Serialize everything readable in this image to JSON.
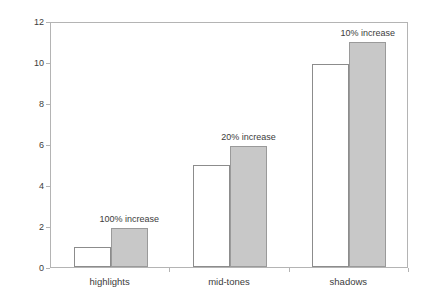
{
  "chart_data": {
    "type": "bar",
    "title": "",
    "xlabel": "",
    "ylabel": "units of exposure",
    "categories": [
      "highlights",
      "mid-tones",
      "shadows"
    ],
    "series": [
      {
        "name": "before",
        "values": [
          1.0,
          5.0,
          9.9
        ]
      },
      {
        "name": "after",
        "values": [
          1.9,
          5.9,
          11.0
        ]
      }
    ],
    "annotations": [
      "100% increase",
      "20% increase",
      "10% increase"
    ],
    "ylim": [
      0,
      12
    ],
    "yticks": [
      0,
      2,
      4,
      6,
      8,
      10,
      12
    ],
    "ytick_labels": [
      "0",
      "2",
      "4",
      "6",
      "8",
      "10",
      "12"
    ],
    "grid": false,
    "legend": "none",
    "colors": {
      "open_bar_fill": "#ffffff",
      "open_bar_edge": "#8c8c8c",
      "filled_bar_fill": "#c8c8c8",
      "filled_bar_edge": "#9a9a9a",
      "axis": "#b4b4b4",
      "text": "#3c3c3c",
      "background": "#ffffff"
    }
  }
}
